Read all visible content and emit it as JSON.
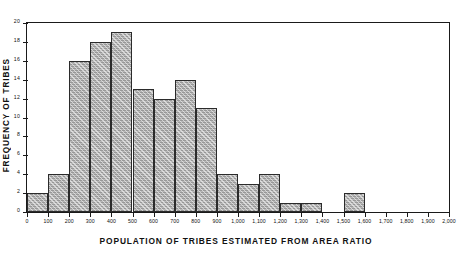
{
  "chart_data": {
    "type": "bar",
    "title": "",
    "xlabel": "POPULATION OF TRIBES ESTIMATED FROM AREA RATIO",
    "ylabel": "FREQUENCY OF TRIBES",
    "xlim": [
      0,
      2000
    ],
    "ylim": [
      0,
      20
    ],
    "bin_width": 100,
    "grid": false,
    "legend": null,
    "xtick_labels": [
      "0",
      "100",
      "200",
      "300",
      "400",
      "500",
      "600",
      "700",
      "800",
      "900",
      "1,000",
      "1,100",
      "1,200",
      "1,300",
      "1,400",
      "1,500",
      "1,600",
      "1,700",
      "1,800",
      "1,900",
      "2,000"
    ],
    "xtick_values": [
      0,
      100,
      200,
      300,
      400,
      500,
      600,
      700,
      800,
      900,
      1000,
      1100,
      1200,
      1300,
      1400,
      1500,
      1600,
      1700,
      1800,
      1900,
      2000
    ],
    "ytick_labels": [
      "0",
      "2",
      "4",
      "6",
      "8",
      "10",
      "12",
      "14",
      "16",
      "18",
      "20"
    ],
    "ytick_values": [
      0,
      2,
      4,
      6,
      8,
      10,
      12,
      14,
      16,
      18,
      20
    ],
    "bins": [
      {
        "start": 0,
        "end": 100,
        "value": 2
      },
      {
        "start": 100,
        "end": 200,
        "value": 4
      },
      {
        "start": 200,
        "end": 300,
        "value": 16
      },
      {
        "start": 300,
        "end": 400,
        "value": 18
      },
      {
        "start": 400,
        "end": 500,
        "value": 19
      },
      {
        "start": 500,
        "end": 600,
        "value": 13
      },
      {
        "start": 600,
        "end": 700,
        "value": 12
      },
      {
        "start": 700,
        "end": 800,
        "value": 14
      },
      {
        "start": 800,
        "end": 900,
        "value": 11
      },
      {
        "start": 900,
        "end": 1000,
        "value": 4
      },
      {
        "start": 1000,
        "end": 1100,
        "value": 3
      },
      {
        "start": 1100,
        "end": 1200,
        "value": 4
      },
      {
        "start": 1200,
        "end": 1300,
        "value": 1
      },
      {
        "start": 1300,
        "end": 1400,
        "value": 1
      },
      {
        "start": 1400,
        "end": 1500,
        "value": 0
      },
      {
        "start": 1500,
        "end": 1600,
        "value": 2
      },
      {
        "start": 1600,
        "end": 1700,
        "value": 0
      },
      {
        "start": 1700,
        "end": 1800,
        "value": 0
      },
      {
        "start": 1800,
        "end": 1900,
        "value": 0
      },
      {
        "start": 1900,
        "end": 2000,
        "value": 0
      }
    ],
    "categories": [
      "0-100",
      "100-200",
      "200-300",
      "300-400",
      "400-500",
      "500-600",
      "600-700",
      "700-800",
      "800-900",
      "900-1000",
      "1000-1100",
      "1100-1200",
      "1200-1300",
      "1300-1400",
      "1400-1500",
      "1500-1600",
      "1600-1700",
      "1700-1800",
      "1800-1900",
      "1900-2000"
    ],
    "values": [
      2,
      4,
      16,
      18,
      19,
      13,
      12,
      14,
      11,
      4,
      3,
      4,
      1,
      1,
      0,
      2,
      0,
      0,
      0,
      0
    ],
    "colors": {
      "bar_fill": "#b9b9b9",
      "bar_edge": "#2b2b2b",
      "axis": "#1a1a1a",
      "background": "#ffffff",
      "text": "#111111"
    }
  }
}
